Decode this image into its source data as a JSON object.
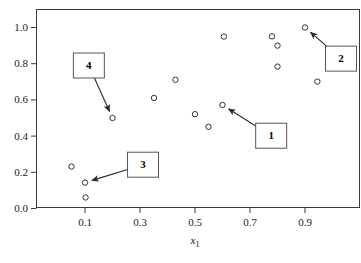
{
  "chart_data": {
    "type": "scatter",
    "title": "",
    "xlabel": "x₁",
    "ylabel": "",
    "xlim": [
      -0.0273,
      1.1545
    ],
    "ylim": [
      -0.1492,
      1.0994
    ],
    "grid": false,
    "legend": null,
    "marker": "open-circle",
    "xticks": [
      "0.1",
      "0.3",
      "0.5",
      "0.7",
      "0.9"
    ],
    "xtick_values": [
      0.1,
      0.3,
      0.5,
      0.7,
      0.9
    ],
    "yticks": [
      "0.0",
      "0.2",
      "0.4",
      "0.6",
      "0.8",
      "1.0"
    ],
    "ytick_values": [
      0.0,
      0.2,
      0.4,
      0.6,
      0.8,
      1.0
    ],
    "points": [
      {
        "x": 0.051,
        "y": 0.232
      },
      {
        "x": 0.1,
        "y": 0.143
      },
      {
        "x": 0.102,
        "y": 0.061
      },
      {
        "x": 0.2,
        "y": 0.5
      },
      {
        "x": 0.351,
        "y": 0.611
      },
      {
        "x": 0.429,
        "y": 0.711
      },
      {
        "x": 0.5,
        "y": 0.521
      },
      {
        "x": 0.549,
        "y": 0.451
      },
      {
        "x": 0.6,
        "y": 0.572
      },
      {
        "x": 0.605,
        "y": 0.95
      },
      {
        "x": 0.78,
        "y": 0.951
      },
      {
        "x": 0.8,
        "y": 0.9
      },
      {
        "x": 0.8,
        "y": 0.784
      },
      {
        "x": 0.9,
        "y": 1.0
      },
      {
        "x": 0.945,
        "y": 0.701
      }
    ],
    "annotations": [
      {
        "label": "1",
        "box": {
          "x": 0.777,
          "y": 0.402
        },
        "target": {
          "x": 0.6,
          "y": 0.572
        }
      },
      {
        "label": "2",
        "box": {
          "x": 1.031,
          "y": 0.828
        },
        "target": {
          "x": 0.9,
          "y": 1.0
        }
      },
      {
        "label": "3",
        "box": {
          "x": 0.311,
          "y": 0.242
        },
        "target": {
          "x": 0.1,
          "y": 0.143
        }
      },
      {
        "label": "4",
        "box": {
          "x": 0.114,
          "y": 0.79
        },
        "target": {
          "x": 0.2,
          "y": 0.5
        }
      }
    ]
  },
  "axis": {
    "x_title": "x",
    "x_title_sub": "1"
  },
  "callouts": [
    {
      "id": "1",
      "text": "1"
    },
    {
      "id": "2",
      "text": "2"
    },
    {
      "id": "3",
      "text": "3"
    },
    {
      "id": "4",
      "text": "4"
    }
  ],
  "colors": {
    "frame": "#3a3a3a",
    "marker_stroke": "#333333",
    "marker_fill": "#ffffff",
    "arrow": "#2b2b2b",
    "box_stroke": "#555555",
    "text": "#111111",
    "background": "#ffffff"
  }
}
